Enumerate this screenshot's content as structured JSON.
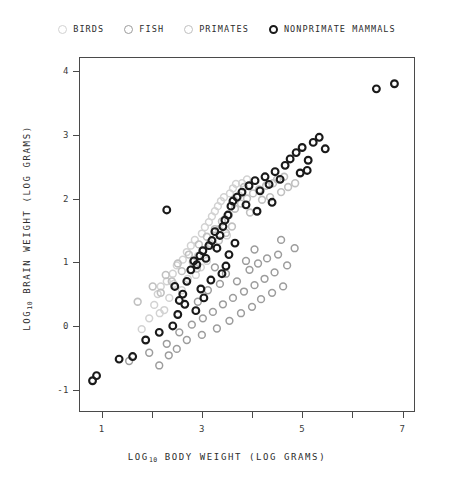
{
  "chart_data": {
    "type": "scatter",
    "title": "",
    "xlabel": "LOG10 BODY WEIGHT (LOG GRAMS)",
    "ylabel": "LOG10 BRAIN WEIGHT (LOG GRAMS)",
    "xlabel_parts": {
      "prefix": "LOG",
      "sub": "10",
      "suffix": " BODY WEIGHT  (LOG GRAMS)"
    },
    "ylabel_parts": {
      "prefix": "LOG",
      "sub": "10",
      "suffix": " BRAIN WEIGHT  (LOG GRAMS)"
    },
    "xlim": [
      0.55,
      7.25
    ],
    "ylim": [
      -1.35,
      4.22
    ],
    "grid": false,
    "legend_position": "top-center",
    "xticks": [
      {
        "value": 1,
        "label": "1"
      },
      {
        "value": 2,
        "label": ""
      },
      {
        "value": 3,
        "label": "3"
      },
      {
        "value": 4,
        "label": ""
      },
      {
        "value": 5,
        "label": "5"
      },
      {
        "value": 6,
        "label": ""
      },
      {
        "value": 7,
        "label": "7"
      }
    ],
    "yticks": [
      {
        "value": 4,
        "label": "4"
      },
      {
        "value": 3,
        "label": "3"
      },
      {
        "value": 2,
        "label": "2"
      },
      {
        "value": 1,
        "label": "1"
      },
      {
        "value": 0,
        "label": "0"
      },
      {
        "value": -1,
        "label": "-1"
      }
    ],
    "marker": {
      "shape": "circle",
      "radius": 3.4,
      "fill": "none"
    },
    "series": [
      {
        "name": "BIRDS",
        "color": "#d2d2d2",
        "stroke_width": 1.5,
        "points": [
          [
            1.95,
            0.12
          ],
          [
            2.05,
            0.33
          ],
          [
            2.12,
            0.5
          ],
          [
            2.18,
            0.62
          ],
          [
            2.3,
            0.7
          ],
          [
            2.42,
            0.82
          ],
          [
            2.35,
            0.44
          ],
          [
            2.5,
            0.95
          ],
          [
            2.62,
            1.04
          ],
          [
            2.7,
            1.16
          ],
          [
            2.78,
            1.26
          ],
          [
            2.86,
            1.35
          ],
          [
            2.92,
            1.1
          ],
          [
            3.0,
            1.45
          ],
          [
            3.06,
            1.55
          ],
          [
            3.14,
            1.63
          ],
          [
            3.2,
            1.72
          ],
          [
            3.26,
            1.8
          ],
          [
            3.32,
            1.88
          ],
          [
            3.38,
            1.96
          ],
          [
            3.44,
            2.02
          ],
          [
            3.5,
            1.42
          ],
          [
            3.1,
            1.02
          ],
          [
            2.6,
            0.56
          ],
          [
            2.25,
            0.25
          ],
          [
            1.8,
            -0.05
          ],
          [
            3.56,
            2.08
          ],
          [
            3.62,
            2.16
          ],
          [
            3.68,
            2.23
          ],
          [
            3.74,
            2.05
          ],
          [
            2.98,
            0.92
          ],
          [
            2.44,
            0.66
          ],
          [
            3.34,
            1.52
          ],
          [
            3.8,
            2.24
          ],
          [
            2.88,
            0.8
          ],
          [
            3.9,
            2.3
          ],
          [
            2.16,
            0.2
          ],
          [
            2.72,
            0.74
          ],
          [
            3.46,
            1.68
          ],
          [
            3.16,
            1.3
          ]
        ]
      },
      {
        "name": "FISH",
        "color": "#9c9c9c",
        "stroke_width": 1.5,
        "points": [
          [
            1.55,
            -0.55
          ],
          [
            1.95,
            -0.42
          ],
          [
            2.3,
            -0.28
          ],
          [
            2.55,
            -0.1
          ],
          [
            2.8,
            0.02
          ],
          [
            3.02,
            0.12
          ],
          [
            3.22,
            0.22
          ],
          [
            3.42,
            0.34
          ],
          [
            3.62,
            0.44
          ],
          [
            3.84,
            0.54
          ],
          [
            4.05,
            0.64
          ],
          [
            4.25,
            0.74
          ],
          [
            4.45,
            0.84
          ],
          [
            3.3,
            -0.04
          ],
          [
            3.55,
            0.08
          ],
          [
            3.78,
            0.2
          ],
          [
            4.0,
            0.3
          ],
          [
            4.18,
            0.42
          ],
          [
            4.4,
            0.52
          ],
          [
            4.62,
            0.62
          ],
          [
            2.7,
            -0.22
          ],
          [
            3.0,
            -0.14
          ],
          [
            2.5,
            -0.36
          ],
          [
            3.7,
            0.7
          ],
          [
            3.95,
            0.88
          ],
          [
            4.12,
            0.98
          ],
          [
            4.3,
            1.06
          ],
          [
            4.52,
            1.12
          ],
          [
            3.88,
            1.02
          ],
          [
            3.48,
            0.82
          ],
          [
            3.12,
            0.56
          ],
          [
            2.92,
            0.38
          ],
          [
            4.7,
            0.95
          ],
          [
            4.85,
            1.22
          ],
          [
            3.36,
            0.66
          ],
          [
            4.58,
            1.35
          ],
          [
            2.34,
            -0.46
          ],
          [
            3.26,
            0.92
          ],
          [
            4.05,
            1.2
          ],
          [
            2.15,
            -0.62
          ]
        ]
      },
      {
        "name": "PRIMATES",
        "color": "#c0c0c0",
        "stroke_width": 1.6,
        "points": [
          [
            1.72,
            0.38
          ],
          [
            2.02,
            0.62
          ],
          [
            2.28,
            0.8
          ],
          [
            2.52,
            0.98
          ],
          [
            2.74,
            1.12
          ],
          [
            2.94,
            1.28
          ],
          [
            3.1,
            1.4
          ],
          [
            3.26,
            1.52
          ],
          [
            3.4,
            1.64
          ],
          [
            3.54,
            1.74
          ],
          [
            3.66,
            1.84
          ],
          [
            3.78,
            1.92
          ],
          [
            3.9,
            2.0
          ],
          [
            4.02,
            2.08
          ],
          [
            4.14,
            2.14
          ],
          [
            4.28,
            2.2
          ],
          [
            4.42,
            2.24
          ],
          [
            4.58,
            2.1
          ],
          [
            4.72,
            2.18
          ],
          [
            4.2,
            1.98
          ],
          [
            3.96,
            1.78
          ],
          [
            3.6,
            1.56
          ],
          [
            3.34,
            1.34
          ],
          [
            3.02,
            1.18
          ],
          [
            2.82,
            1.0
          ],
          [
            2.6,
            0.86
          ],
          [
            2.4,
            0.7
          ],
          [
            2.18,
            0.52
          ],
          [
            4.5,
            2.3
          ],
          [
            4.86,
            2.24
          ],
          [
            3.84,
            2.18
          ],
          [
            3.48,
            1.46
          ],
          [
            4.36,
            2.02
          ],
          [
            3.18,
            1.26
          ],
          [
            2.9,
            0.9
          ],
          [
            4.64,
            2.34
          ]
        ]
      },
      {
        "name": "NONPRIMATE MAMMALS",
        "color": "#1a1a1a",
        "stroke_width": 2.1,
        "points": [
          [
            0.82,
            -0.86
          ],
          [
            0.9,
            -0.78
          ],
          [
            1.35,
            -0.52
          ],
          [
            1.62,
            -0.48
          ],
          [
            1.88,
            -0.22
          ],
          [
            2.15,
            -0.1
          ],
          [
            2.42,
            0.0
          ],
          [
            2.3,
            1.82
          ],
          [
            2.55,
            0.4
          ],
          [
            2.62,
            0.5
          ],
          [
            2.46,
            0.62
          ],
          [
            2.7,
            0.7
          ],
          [
            2.78,
            0.88
          ],
          [
            2.84,
            1.02
          ],
          [
            2.9,
            0.96
          ],
          [
            2.96,
            1.1
          ],
          [
            3.02,
            1.18
          ],
          [
            3.08,
            1.06
          ],
          [
            3.14,
            1.26
          ],
          [
            3.2,
            1.34
          ],
          [
            3.26,
            1.48
          ],
          [
            3.3,
            1.22
          ],
          [
            3.36,
            1.42
          ],
          [
            3.42,
            1.56
          ],
          [
            3.46,
            1.66
          ],
          [
            3.52,
            1.74
          ],
          [
            3.58,
            1.88
          ],
          [
            3.62,
            1.96
          ],
          [
            3.4,
            0.82
          ],
          [
            3.48,
            0.94
          ],
          [
            3.18,
            0.72
          ],
          [
            2.98,
            0.58
          ],
          [
            3.7,
            2.02
          ],
          [
            3.8,
            2.1
          ],
          [
            3.88,
            1.9
          ],
          [
            3.94,
            2.2
          ],
          [
            4.06,
            2.28
          ],
          [
            4.16,
            2.12
          ],
          [
            4.26,
            2.34
          ],
          [
            4.34,
            2.22
          ],
          [
            4.46,
            2.42
          ],
          [
            4.56,
            2.3
          ],
          [
            4.66,
            2.52
          ],
          [
            4.76,
            2.62
          ],
          [
            4.88,
            2.72
          ],
          [
            5.0,
            2.8
          ],
          [
            5.12,
            2.6
          ],
          [
            5.22,
            2.88
          ],
          [
            5.34,
            2.96
          ],
          [
            5.46,
            2.78
          ],
          [
            5.1,
            2.44
          ],
          [
            4.96,
            2.4
          ],
          [
            6.48,
            3.72
          ],
          [
            6.84,
            3.8
          ],
          [
            2.66,
            0.34
          ],
          [
            2.52,
            0.18
          ],
          [
            3.04,
            0.44
          ],
          [
            3.54,
            1.12
          ],
          [
            3.66,
            1.3
          ],
          [
            4.1,
            1.8
          ],
          [
            4.4,
            1.94
          ],
          [
            2.88,
            0.24
          ]
        ]
      }
    ]
  },
  "legend": {
    "entries": [
      {
        "label": "BIRDS",
        "marker_name": "legend-marker-birds"
      },
      {
        "label": "FISH",
        "marker_name": "legend-marker-fish"
      },
      {
        "label": "PRIMATES",
        "marker_name": "legend-marker-primates"
      },
      {
        "label": "NONPRIMATE MAMMALS",
        "marker_name": "legend-marker-nonprimate-mammals"
      }
    ]
  }
}
